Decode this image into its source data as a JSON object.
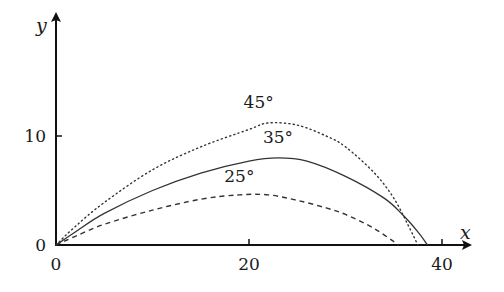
{
  "chart_data": {
    "type": "line",
    "title": "",
    "xlabel": "x",
    "ylabel": "y",
    "xlim": [
      0,
      42
    ],
    "ylim": [
      0,
      21
    ],
    "xticks": [
      0,
      20,
      40
    ],
    "yticks": [
      0,
      10
    ],
    "xtick_labels": [
      "0",
      "20",
      "40"
    ],
    "ytick_labels": [
      "0",
      "10"
    ],
    "grid": false,
    "legend": "inline labels above each curve",
    "series": [
      {
        "name": "45°",
        "style": "dotted",
        "label_at": [
          21,
          12.6
        ],
        "x": [
          0,
          2,
          5,
          10,
          15,
          20,
          22,
          25,
          28,
          30,
          33,
          35,
          36.5,
          37.5
        ],
        "y": [
          0,
          1.7,
          3.9,
          6.9,
          9.0,
          10.6,
          11.2,
          11.0,
          10.0,
          9.0,
          6.6,
          4.3,
          1.8,
          0
        ]
      },
      {
        "name": "35°",
        "style": "solid",
        "label_at": [
          23,
          9.4
        ],
        "x": [
          0,
          2,
          5,
          10,
          15,
          20,
          23,
          26,
          30,
          34,
          36,
          37.5,
          38.5
        ],
        "y": [
          0,
          1.2,
          2.9,
          5.0,
          6.6,
          7.7,
          8.0,
          7.7,
          6.3,
          4.3,
          2.7,
          1.2,
          0
        ]
      },
      {
        "name": "25°",
        "style": "dashed",
        "label_at": [
          19,
          5.8
        ],
        "x": [
          0,
          2,
          5,
          10,
          15,
          19,
          22,
          25,
          28,
          30,
          33,
          35.5
        ],
        "y": [
          0,
          0.8,
          1.9,
          3.2,
          4.2,
          4.6,
          4.6,
          4.1,
          3.4,
          2.8,
          1.5,
          0
        ]
      }
    ]
  }
}
